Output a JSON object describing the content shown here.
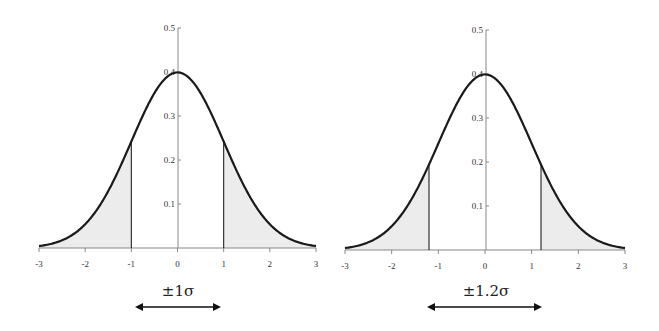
{
  "chart_data": [
    {
      "type": "area",
      "title": "",
      "curve": "standard normal density",
      "xlabel": "",
      "ylabel": "",
      "xlim": [
        -3,
        3
      ],
      "ylim": [
        0,
        0.5
      ],
      "x_ticks": [
        "-3",
        "-2",
        "-1",
        "0",
        "1",
        "2",
        "3"
      ],
      "y_ticks": [
        "0.1",
        "0.2",
        "0.3",
        "0.4",
        "0.5"
      ],
      "peak": {
        "x": 0,
        "y": 0.4
      },
      "cutoffs": [
        -1,
        1
      ],
      "cutoff_heights": [
        0.242,
        0.242
      ],
      "shaded_regions": [
        "x < -1",
        "x > 1"
      ],
      "annotation": "±1σ",
      "grid": false
    },
    {
      "type": "area",
      "title": "",
      "curve": "standard normal density",
      "xlabel": "",
      "ylabel": "",
      "xlim": [
        -3,
        3
      ],
      "ylim": [
        0,
        0.5
      ],
      "x_ticks": [
        "-3",
        "-2",
        "-1",
        "0",
        "1",
        "2",
        "3"
      ],
      "y_ticks": [
        "0.1",
        "0.2",
        "0.3",
        "0.4",
        "0.5"
      ],
      "peak": {
        "x": 0,
        "y": 0.4
      },
      "cutoffs": [
        -1.2,
        1.2
      ],
      "cutoff_heights": [
        0.194,
        0.194
      ],
      "shaded_regions": [
        "x < -1.2",
        "x > 1.2"
      ],
      "annotation": "±1.2σ",
      "grid": false
    }
  ],
  "charts": {
    "left": {
      "annotation": "±1σ",
      "x_ticks": [
        "-3",
        "-2",
        "-1",
        "0",
        "1",
        "2",
        "3"
      ],
      "y_ticks": [
        "0.1",
        "0.2",
        "0.3",
        "0.4",
        "0.5"
      ]
    },
    "right": {
      "annotation": "±1.2σ",
      "x_ticks": [
        "-3",
        "-2",
        "-1",
        "0",
        "1",
        "2",
        "3"
      ],
      "y_ticks": [
        "0.1",
        "0.2",
        "0.3",
        "0.4",
        "0.5"
      ]
    }
  },
  "colors": {
    "curve": "#1a1a1a",
    "axis": "#888888",
    "shade": "#ececec",
    "cutoff_line": "#222222",
    "arrow": "#111111"
  }
}
